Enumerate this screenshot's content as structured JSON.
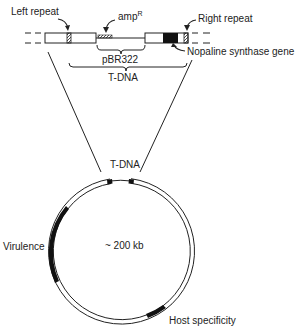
{
  "figure": {
    "type": "plasmid-map"
  },
  "tdna_map": {
    "labels": {
      "left_repeat": "Left repeat",
      "amp": "amp",
      "amp_superscript": "R",
      "right_repeat": "Right repeat",
      "pbr322": "pBR322",
      "nopaline": "Nopaline synthase gene",
      "tdna": "T-DNA"
    }
  },
  "plasmid": {
    "labels": {
      "tdna": "T-DNA",
      "size": "~ 200 kb",
      "virulence": "Virulence",
      "host_specificity": "Host specificity"
    },
    "colors": {
      "line": "#222222",
      "region": "#111111",
      "background": "#ffffff"
    }
  }
}
